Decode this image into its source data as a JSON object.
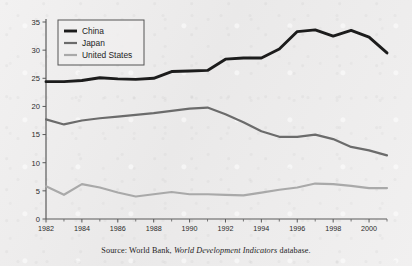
{
  "source_note": {
    "prefix": "Source: World Bank,",
    "publication": "World Development Indicators",
    "suffix": "database."
  },
  "legend": {
    "items": [
      {
        "label": "China",
        "color": "#1c1c1c",
        "width": 2.9
      },
      {
        "label": "Japan",
        "color": "#6b6b6b",
        "width": 2.2
      },
      {
        "label": "United States",
        "color": "#a9a9a9",
        "width": 2.2
      }
    ]
  },
  "chart_data": {
    "type": "line",
    "title": "",
    "subtitle": "",
    "xlabel": "",
    "ylabel": "",
    "xlim": [
      1982,
      2001
    ],
    "ylim": [
      0,
      35
    ],
    "yticks": [
      0,
      5,
      10,
      15,
      20,
      25,
      30,
      35
    ],
    "xticks": [
      1982,
      1984,
      1986,
      1988,
      1990,
      1992,
      1994,
      1996,
      1998,
      2000
    ],
    "x_minor_ticks": [
      1983,
      1985,
      1987,
      1989,
      1991,
      1993,
      1995,
      1997,
      1999,
      2001
    ],
    "grid": false,
    "legend_position": "top-left",
    "x": [
      1982,
      1983,
      1984,
      1985,
      1986,
      1987,
      1988,
      1989,
      1990,
      1991,
      1992,
      1993,
      1994,
      1995,
      1996,
      1997,
      1998,
      1999,
      2000,
      2001
    ],
    "series": [
      {
        "name": "China",
        "color": "#1c1c1c",
        "width": 2.9,
        "values": [
          24.4,
          24.4,
          24.6,
          25.1,
          24.9,
          24.8,
          25.0,
          26.2,
          26.3,
          26.4,
          28.4,
          28.6,
          28.6,
          30.2,
          33.3,
          33.6,
          32.5,
          33.5,
          32.3,
          29.5
        ]
      },
      {
        "name": "Japan",
        "color": "#6b6b6b",
        "width": 2.2,
        "values": [
          17.7,
          16.8,
          17.5,
          17.9,
          18.2,
          18.5,
          18.8,
          19.2,
          19.6,
          19.8,
          18.6,
          17.2,
          15.6,
          14.6,
          14.6,
          15.0,
          14.2,
          12.8,
          12.2,
          11.3
        ]
      },
      {
        "name": "United States",
        "color": "#a9a9a9",
        "width": 2.2,
        "values": [
          5.8,
          4.3,
          6.2,
          5.6,
          4.7,
          4.0,
          4.4,
          4.8,
          4.4,
          4.4,
          4.3,
          4.2,
          4.7,
          5.2,
          5.6,
          6.3,
          6.2,
          5.9,
          5.5,
          5.5
        ]
      }
    ]
  }
}
